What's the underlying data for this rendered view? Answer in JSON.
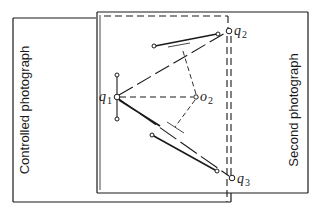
{
  "diagram": {
    "labels": {
      "left_photo": "Controlled photograph",
      "right_photo": "Second photograph"
    },
    "points": [
      {
        "id": "q1",
        "symbol": "q",
        "subscript": "1",
        "x": 116,
        "y": 97
      },
      {
        "id": "o2",
        "symbol": "o",
        "subscript": "2",
        "x": 197,
        "y": 97
      },
      {
        "id": "q2",
        "symbol": "q",
        "subscript": "2",
        "x": 229,
        "y": 31
      },
      {
        "id": "q3",
        "symbol": "q",
        "subscript": "3",
        "x": 232,
        "y": 178
      }
    ],
    "colors": {
      "line": "#1a1a1a",
      "background": "#ffffff"
    }
  }
}
